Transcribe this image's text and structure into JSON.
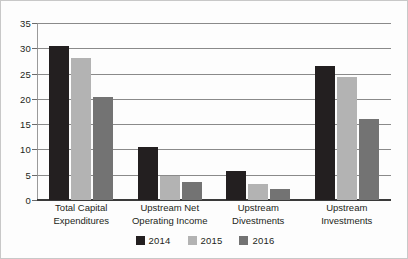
{
  "chart_data": {
    "type": "bar",
    "title": "",
    "subtitle": "",
    "xlabel": "",
    "ylabel": "",
    "ylim": [
      0,
      35
    ],
    "ytick_labels": [
      "0",
      "5",
      "10",
      "15",
      "20",
      "25",
      "30",
      "35"
    ],
    "ytick_values": [
      0,
      5,
      10,
      15,
      20,
      25,
      30,
      35
    ],
    "grid": true,
    "legend_position": "bottom-center",
    "categories": [
      "Total Capital Expenditures",
      "Upstream Net Operating Income",
      "Upstream Divestments",
      "Upstream Investments"
    ],
    "category_label_lines": [
      [
        "Total Capital",
        "Expenditures"
      ],
      [
        "Upstream Net",
        "Operating Income"
      ],
      [
        "Upstream",
        "Divestments"
      ],
      [
        "Upstream",
        "Investments"
      ]
    ],
    "series": [
      {
        "name": "2014",
        "color": "#231f20",
        "values": [
          30.5,
          10.5,
          5.8,
          26.5
        ]
      },
      {
        "name": "2015",
        "color": "#b3b3b3",
        "values": [
          28.0,
          4.7,
          3.2,
          24.3
        ]
      },
      {
        "name": "2016",
        "color": "#737373",
        "values": [
          20.3,
          3.5,
          2.2,
          16.0
        ]
      }
    ]
  },
  "legend": {
    "entries": [
      {
        "label": "2014",
        "color": "#231f20"
      },
      {
        "label": "2015",
        "color": "#b3b3b3"
      },
      {
        "label": "2016",
        "color": "#737373"
      }
    ]
  },
  "colors": {
    "series_2014": "#231f20",
    "series_2015": "#b3b3b3",
    "series_2016": "#737373",
    "gridline": "#8a8a8a",
    "axis": "#3a3a3a",
    "text": "#231f20",
    "background": "#fdfdfd",
    "border": "#c8c8c8"
  }
}
